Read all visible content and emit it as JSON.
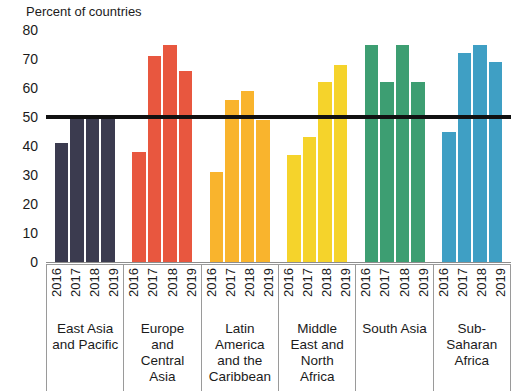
{
  "chart_data": {
    "type": "bar",
    "title": "Percent of countries",
    "xlabel": "",
    "ylabel": "Percent of countries",
    "ylim": [
      0,
      80
    ],
    "yticks": [
      0,
      10,
      20,
      30,
      40,
      50,
      60,
      70,
      80
    ],
    "grid": false,
    "legend": "none",
    "categories": [
      "2016",
      "2017",
      "2018",
      "2019"
    ],
    "groups": [
      {
        "name": "East Asia and Pacific",
        "name_lines": "East Asia\nand Pacific",
        "color": "#3b3b4f",
        "values": [
          41,
          50,
          50,
          50
        ]
      },
      {
        "name": "Europe and Central Asia",
        "name_lines": "Europe\nand\nCentral\nAsia",
        "color": "#e8573f",
        "values": [
          38,
          71,
          75,
          66
        ]
      },
      {
        "name": "Latin America and the Caribbean",
        "name_lines": "Latin\nAmerica\nand the\nCaribbean",
        "color": "#f9b42d",
        "values": [
          31,
          56,
          59,
          49
        ]
      },
      {
        "name": "Middle East and North Africa",
        "name_lines": "Middle\nEast and\nNorth\nAfrica",
        "color": "#f5d32b",
        "values": [
          37,
          43,
          62,
          68
        ]
      },
      {
        "name": "South Asia",
        "name_lines": "South Asia",
        "color": "#3d9e72",
        "values": [
          75,
          62,
          75,
          62
        ]
      },
      {
        "name": "Sub-Saharan Africa",
        "name_lines": "Sub-\nSaharan\nAfrica",
        "color": "#3f9fc4",
        "values": [
          45,
          72,
          75,
          69
        ]
      }
    ],
    "reference_line": {
      "value": 50,
      "color": "#111111",
      "label": ""
    }
  }
}
